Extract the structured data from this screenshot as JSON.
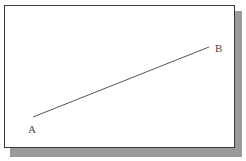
{
  "figure": {
    "title": "",
    "background_color": "#ffffff",
    "frame": {
      "border_color": "#3a3a3a",
      "fill_color": "#ffffff",
      "shadow_color": "#9a9a9a"
    }
  },
  "chart_data": {
    "type": "line",
    "title": "",
    "xlabel": "",
    "ylabel": "",
    "grid": false,
    "legend": null,
    "series": [
      {
        "name": "segment-AB",
        "color": "#555555",
        "points": [
          {
            "label": "A",
            "x": 33,
            "y": 117
          },
          {
            "label": "B",
            "x": 209,
            "y": 47
          }
        ]
      }
    ]
  },
  "labels": {
    "point_a": "A",
    "point_b": "B"
  },
  "line": {
    "stroke_color": "#555555",
    "stroke_width": 1,
    "x1": 33,
    "y1": 117,
    "x2": 209,
    "y2": 47
  }
}
